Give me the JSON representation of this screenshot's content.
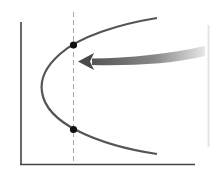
{
  "diagram": {
    "type": "parabola-threshold",
    "axes": {
      "x_label": "",
      "y_label": ""
    },
    "curve": {
      "shape": "sideways-parabola",
      "color": "#555555"
    },
    "threshold_line": {
      "style": "dashed",
      "color": "#aaaaaa"
    },
    "points": [
      {
        "name": "upper-intersection"
      },
      {
        "name": "lower-intersection"
      }
    ],
    "arrow": {
      "direction": "left",
      "color": "#666666"
    }
  }
}
